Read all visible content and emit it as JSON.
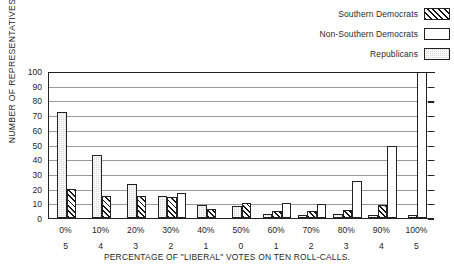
{
  "legend": {
    "position": "top-right",
    "items": [
      {
        "label": "Southern Democrats",
        "pattern": "diagonal-hatch",
        "color": "#ffffff"
      },
      {
        "label": "Non-Southern Democrats",
        "pattern": "empty",
        "color": "#ffffff"
      },
      {
        "label": "Republicans",
        "pattern": "stipple-grey",
        "color": "#d8d8d8"
      }
    ]
  },
  "axes": {
    "y_title": "NUMBER OF REPRESENTATIVES",
    "y_ticks": [
      "0",
      "10",
      "20",
      "30",
      "40",
      "50",
      "60",
      "70",
      "80",
      "90",
      "100"
    ],
    "x_title": "PERCENTAGE OF \"LIBERAL\" VOTES ON TEN ROLL-CALLS.",
    "x_ticks": [
      "0%",
      "10%",
      "20%",
      "30%",
      "40%",
      "50%",
      "60%",
      "70%",
      "80%",
      "90%",
      "100%"
    ],
    "x_subticks": [
      "5",
      "4",
      "3",
      "2",
      "1",
      "0",
      "1",
      "2",
      "3",
      "4",
      "5"
    ]
  },
  "chart_data": {
    "type": "bar",
    "title": "",
    "subtitle": "",
    "xlabel": "PERCENTAGE OF \"LIBERAL\" VOTES ON TEN ROLL-CALLS.",
    "ylabel": "NUMBER OF REPRESENTATIVES",
    "ylim": [
      0,
      100
    ],
    "ytick_step": 10,
    "grid": "horizontal",
    "legend_position": "top-right",
    "categories": [
      "0%",
      "10%",
      "20%",
      "30%",
      "40%",
      "50%",
      "60%",
      "70%",
      "80%",
      "90%",
      "100%"
    ],
    "secondary_categories": [
      "5",
      "4",
      "3",
      "2",
      "1",
      "0",
      "1",
      "2",
      "3",
      "4",
      "5"
    ],
    "series": [
      {
        "name": "Southern Democrats",
        "pattern": "diagonal-hatch",
        "values": [
          20,
          15,
          15,
          14,
          6,
          10,
          5,
          5,
          5.5,
          9,
          0
        ]
      },
      {
        "name": "Non-Southern Democrats",
        "pattern": "empty",
        "values": [
          0,
          0,
          0,
          17,
          0,
          0,
          10,
          9.5,
          25,
          49,
          99
        ]
      },
      {
        "name": "Republicans",
        "pattern": "stipple-grey",
        "values": [
          72,
          43,
          23,
          15,
          9,
          8,
          3,
          2,
          3,
          2,
          2
        ]
      }
    ]
  }
}
